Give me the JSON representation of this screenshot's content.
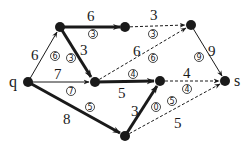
{
  "diagram": {
    "type": "network-flow",
    "colors": {
      "ink": "#1a1a1a",
      "background": "#ffffff"
    },
    "nodes": [
      {
        "id": "q",
        "label": "q",
        "x": 28,
        "y": 82
      },
      {
        "id": "A",
        "label": "",
        "x": 60,
        "y": 27
      },
      {
        "id": "B",
        "label": "",
        "x": 125,
        "y": 27
      },
      {
        "id": "C",
        "label": "",
        "x": 191,
        "y": 25
      },
      {
        "id": "D",
        "label": "",
        "x": 95,
        "y": 82
      },
      {
        "id": "E",
        "label": "",
        "x": 160,
        "y": 81
      },
      {
        "id": "F",
        "label": "",
        "x": 125,
        "y": 136
      },
      {
        "id": "s",
        "label": "s",
        "x": 225,
        "y": 81
      }
    ],
    "edges": [
      {
        "from": "q",
        "to": "A",
        "capacity": "6",
        "flow": "6",
        "style": "thin"
      },
      {
        "from": "A",
        "to": "B",
        "capacity": "6",
        "flow": "3",
        "style": "thick"
      },
      {
        "from": "B",
        "to": "C",
        "capacity": "3",
        "flow": "3",
        "style": "dashed"
      },
      {
        "from": "A",
        "to": "D",
        "capacity": "3",
        "flow": "3",
        "style": "thick"
      },
      {
        "from": "q",
        "to": "D",
        "capacity": "7",
        "flow": "7",
        "style": "thin"
      },
      {
        "from": "D",
        "to": "C",
        "capacity": "6",
        "flow": "6",
        "style": "dashed"
      },
      {
        "from": "D",
        "to": "E",
        "capacity": "5",
        "flow": "4",
        "style": "thick"
      },
      {
        "from": "C",
        "to": "s",
        "capacity": "9",
        "flow": "9",
        "style": "thin"
      },
      {
        "from": "E",
        "to": "s",
        "capacity": "4",
        "flow": "4",
        "style": "dashed"
      },
      {
        "from": "q",
        "to": "F",
        "capacity": "8",
        "flow": "5",
        "style": "thick"
      },
      {
        "from": "F",
        "to": "E",
        "capacity": "3",
        "flow": "0",
        "style": "thick"
      },
      {
        "from": "F",
        "to": "s",
        "capacity": "5",
        "flow": "5",
        "style": "dashed"
      }
    ]
  }
}
